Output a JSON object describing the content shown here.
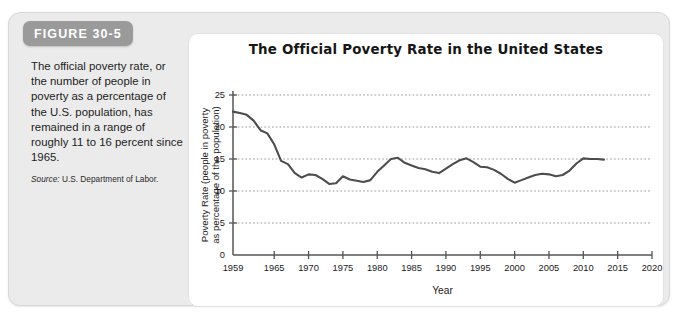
{
  "figure": {
    "badge_label": "FIGURE 30-5",
    "caption": "The official poverty rate, or the number of people in poverty as a percentage of the U.S. population, has remained in a range of roughly 11 to 16 percent since 1965.",
    "source_prefix": "Source:",
    "source_text": "U.S. Department of Labor."
  },
  "colors": {
    "panel_background": "#ebebeb",
    "card_background": "#ffffff",
    "badge": "#9a9a9a",
    "line": "#4d4d4d",
    "axis": "#555555",
    "gridline": "#8c8c8c"
  },
  "chart_data": {
    "type": "line",
    "title": "The Official Poverty Rate in the United States",
    "xlabel": "Year",
    "ylabel": "Poverty Rate (people in poverty as percentage of the population)",
    "ylabel_line1": "Poverty Rate (people in poverty",
    "ylabel_line2": "as percentage of the population)",
    "xlim": [
      1959,
      2020
    ],
    "ylim": [
      0,
      25
    ],
    "yticks": [
      0,
      5,
      10,
      15,
      20,
      25
    ],
    "ytick_labels": [
      "0",
      "5",
      "10",
      "15",
      "20",
      "25"
    ],
    "xticks": [
      1959,
      1965,
      1970,
      1975,
      1980,
      1985,
      1990,
      1995,
      2000,
      2005,
      2010,
      2015,
      2020
    ],
    "xtick_labels": [
      "1959",
      "1965",
      "1970",
      "1975",
      "1980",
      "1985",
      "1990",
      "1995",
      "2000",
      "2005",
      "2010",
      "2015",
      "2020"
    ],
    "grid": true,
    "grid_axis": "y",
    "legend": false,
    "series": [
      {
        "name": "Official poverty rate",
        "x": [
          1959,
          1960,
          1961,
          1962,
          1963,
          1964,
          1965,
          1966,
          1967,
          1968,
          1969,
          1970,
          1971,
          1972,
          1973,
          1974,
          1975,
          1976,
          1977,
          1978,
          1979,
          1980,
          1981,
          1982,
          1983,
          1984,
          1985,
          1986,
          1987,
          1988,
          1989,
          1990,
          1991,
          1992,
          1993,
          1994,
          1995,
          1996,
          1997,
          1998,
          1999,
          2000,
          2001,
          2002,
          2003,
          2004,
          2005,
          2006,
          2007,
          2008,
          2009,
          2010,
          2011,
          2012,
          2013
        ],
        "values": [
          22.4,
          22.2,
          21.9,
          21.0,
          19.5,
          19.0,
          17.3,
          14.7,
          14.2,
          12.8,
          12.1,
          12.6,
          12.5,
          11.9,
          11.1,
          11.2,
          12.3,
          11.8,
          11.6,
          11.4,
          11.7,
          13.0,
          14.0,
          15.0,
          15.2,
          14.4,
          14.0,
          13.6,
          13.4,
          13.0,
          12.8,
          13.5,
          14.2,
          14.8,
          15.1,
          14.5,
          13.8,
          13.7,
          13.3,
          12.7,
          11.9,
          11.3,
          11.7,
          12.1,
          12.5,
          12.7,
          12.6,
          12.3,
          12.5,
          13.2,
          14.3,
          15.1,
          15.0,
          15.0,
          14.9
        ]
      }
    ]
  }
}
